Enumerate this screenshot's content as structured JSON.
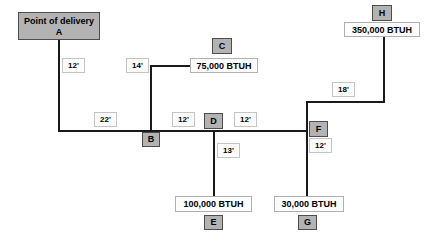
{
  "diagram": {
    "nodes": {
      "a": {
        "label_line1": "Point of delivery",
        "label_line2": "A"
      },
      "b": {
        "label": "B"
      },
      "c": {
        "label": "C",
        "load": "75,000 BTUH"
      },
      "d": {
        "label": "D"
      },
      "e": {
        "label": "E",
        "load": "100,000 BTUH"
      },
      "f": {
        "label": "F"
      },
      "g": {
        "label": "G",
        "load": "30,000 BTUH"
      },
      "h": {
        "label": "H",
        "load": "350,000 BTUH"
      }
    },
    "lengths": {
      "a_drop": "12'",
      "c_riser": "14'",
      "a_to_b": "22'",
      "b_to_d": "12'",
      "d_to_f": "12'",
      "d_to_e": "13'",
      "f_to_h": "18'",
      "f_to_g": "12'"
    },
    "colors": {
      "line": "#1a1a1a",
      "node_fill": "#b3b3b3",
      "node_border": "#4d4d4d",
      "box_fill": "#fdfdfd",
      "box_border": "#b0b0b0",
      "background": "#ffffff"
    }
  }
}
